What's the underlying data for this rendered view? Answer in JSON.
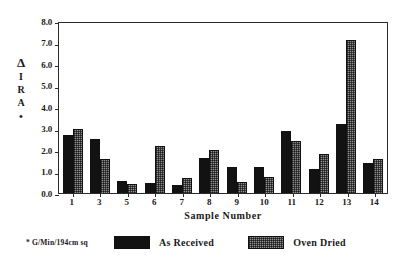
{
  "chart_data": {
    "type": "bar",
    "title": "",
    "xlabel": "Sample Number",
    "ylabel": "Δ IRA *",
    "ylim": [
      0.0,
      8.0
    ],
    "ytick_labels": [
      "8.0",
      "7.0",
      "6.0",
      "5.0",
      "4.0",
      "3.0",
      "2.0",
      "1.0",
      "0.0"
    ],
    "ytick_values": [
      8.0,
      7.0,
      6.0,
      5.0,
      4.0,
      3.0,
      2.0,
      1.0,
      0.0
    ],
    "grid": false,
    "legend_position": "bottom",
    "categories": [
      "1",
      "3",
      "5",
      "6",
      "7",
      "8",
      "9",
      "10",
      "11",
      "12",
      "13",
      "14"
    ],
    "series": [
      {
        "name": "As Received",
        "color": "#121212",
        "values": [
          2.7,
          2.5,
          0.55,
          0.45,
          0.35,
          1.65,
          1.2,
          1.2,
          2.9,
          1.1,
          3.2,
          1.4
        ]
      },
      {
        "name": "Oven Dried",
        "color": "#8e8e8e",
        "values": [
          3.0,
          1.6,
          0.4,
          2.2,
          0.7,
          2.0,
          0.5,
          0.75,
          2.4,
          1.8,
          7.1,
          1.6
        ]
      }
    ],
    "footnote": "* G/Min/194cm sq"
  },
  "ylabel_chars": [
    "Δ",
    "I",
    "R",
    "A",
    "•"
  ],
  "legend": {
    "note": "* G/Min/194cm sq",
    "items": [
      {
        "label": "As Received"
      },
      {
        "label": "Oven Dried"
      }
    ]
  }
}
